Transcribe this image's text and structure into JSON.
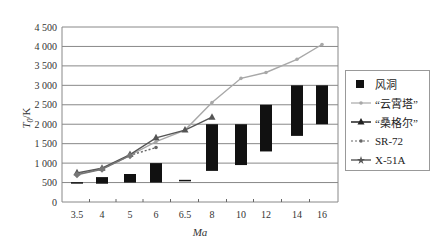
{
  "chart_data": {
    "type": "bar+line",
    "title": "",
    "xlabel": "Ma",
    "ylabel": "T0/K",
    "ylabel_main": "T",
    "ylabel_sub": "0",
    "ylabel_unit": "/K",
    "ylim": [
      0,
      4500
    ],
    "yticks": [
      0,
      500,
      1000,
      1500,
      2000,
      2500,
      3000,
      3500,
      4000,
      4500
    ],
    "ytick_labels": [
      "0",
      "500",
      "1 000",
      "1 500",
      "2 000",
      "2 500",
      "3 000",
      "3 500",
      "4 000",
      "4 500"
    ],
    "categories": [
      "3.5",
      "4",
      "5",
      "6",
      "6.5",
      "8",
      "10",
      "12",
      "14",
      "16"
    ],
    "grid": true,
    "legend_position": "right",
    "series": [
      {
        "name": "风洞",
        "kind": "floating-bar",
        "color": "#111111",
        "ranges": [
          [
            480,
            510
          ],
          [
            470,
            640
          ],
          [
            500,
            720
          ],
          [
            500,
            1000
          ],
          [
            540,
            570
          ],
          [
            800,
            2000
          ],
          [
            950,
            2000
          ],
          [
            1300,
            2500
          ],
          [
            1700,
            3000
          ],
          [
            2000,
            3000
          ]
        ]
      },
      {
        "name": "“云霄塔”",
        "kind": "line",
        "marker": "dot",
        "color": "#a8a8a8",
        "values": [
          720,
          860,
          1200,
          1550,
          1850,
          2560,
          3180,
          3330,
          3670,
          4050
        ]
      },
      {
        "name": "“桑格尔”",
        "kind": "line",
        "marker": "triangle",
        "color": "#555555",
        "values": [
          750,
          870,
          1220,
          1650,
          1850,
          2180,
          null,
          null,
          null,
          null
        ]
      },
      {
        "name": "SR-72",
        "kind": "line",
        "dash": "dotted",
        "marker": "dot",
        "color": "#666666",
        "values": [
          720,
          850,
          1200,
          1400,
          null,
          null,
          null,
          null,
          null,
          null
        ]
      },
      {
        "name": "X-51A",
        "kind": "line",
        "marker": "star",
        "color": "#777777",
        "values": [
          700,
          840,
          1190,
          null,
          null,
          null,
          null,
          null,
          null,
          null
        ]
      }
    ]
  },
  "legend": {
    "items": [
      {
        "label": "风洞",
        "symbol": "square"
      },
      {
        "label": "“云霄塔”",
        "symbol": "line-dot"
      },
      {
        "label": "“桑格尔”",
        "symbol": "line-triangle"
      },
      {
        "label": "SR-72",
        "symbol": "dotted-dot"
      },
      {
        "label": "X-51A",
        "symbol": "line-star"
      }
    ]
  }
}
